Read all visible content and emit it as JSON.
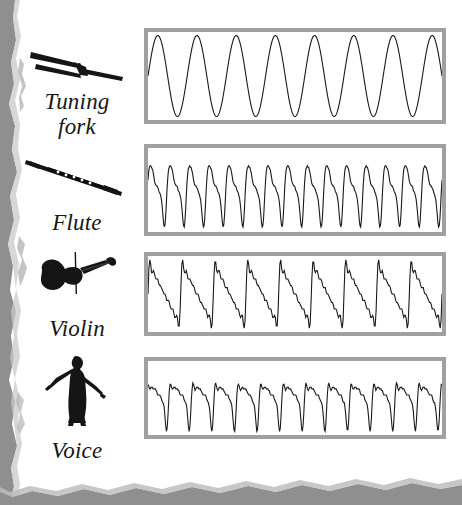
{
  "figure": {
    "background_color": "#ffffff",
    "panel_border_color": "#a0a0a0",
    "wave_color": "#1a1a1a",
    "torn_edge_color": "#8f8f8f"
  },
  "rows": [
    {
      "id": "tuning-fork",
      "label": "Tuning\nfork",
      "label_line1": "Tuning",
      "label_line2": "fork",
      "icon": "tuning-fork-icon"
    },
    {
      "id": "flute",
      "label": "Flute",
      "label_line1": "Flute",
      "label_line2": "",
      "icon": "flute-icon"
    },
    {
      "id": "violin",
      "label": "Violin",
      "label_line1": "Violin",
      "label_line2": "",
      "icon": "violin-icon"
    },
    {
      "id": "voice",
      "label": "Voice",
      "label_line1": "Voice",
      "label_line2": "",
      "icon": "singer-icon"
    }
  ],
  "chart_data": {
    "type": "line",
    "xlabel": "",
    "ylabel": "",
    "grid": false,
    "legend": "none",
    "x": [
      0,
      1
    ],
    "xlim": [
      0,
      1
    ],
    "ylim": [
      -1,
      1
    ],
    "series": [
      {
        "name": "Tuning fork",
        "waveform": "sine",
        "cycles": 7.5,
        "amplitude": 0.92,
        "description": "Pure sinusoid, single frequency, no harmonics",
        "harmonics": [
          {
            "n": 1,
            "amplitude": 1.0,
            "phase": 0.0
          }
        ]
      },
      {
        "name": "Flute",
        "waveform": "complex-periodic",
        "cycles": 15,
        "amplitude": 0.88,
        "description": "Fundamental plus strong second harmonic; rounded double-peak per cycle with deep narrow trough",
        "harmonics": [
          {
            "n": 1,
            "amplitude": 1.0,
            "phase": 0.0
          },
          {
            "n": 2,
            "amplitude": 0.55,
            "phase": 0.35
          },
          {
            "n": 3,
            "amplitude": 0.18,
            "phase": 1.2
          },
          {
            "n": 4,
            "amplitude": 0.1,
            "phase": 2.0
          }
        ]
      },
      {
        "name": "Violin",
        "waveform": "sawtooth",
        "cycles": 9,
        "amplitude": 0.9,
        "description": "Sawtooth-like ramp rising in small steps to a sharp peak, then a steep fall to a narrow trough; rich in all harmonics",
        "harmonics": [
          {
            "n": 1,
            "amplitude": 1.0,
            "phase": 0.0
          },
          {
            "n": 2,
            "amplitude": 0.5,
            "phase": 0.0
          },
          {
            "n": 3,
            "amplitude": 0.33,
            "phase": 0.0
          },
          {
            "n": 4,
            "amplitude": 0.25,
            "phase": 0.0
          },
          {
            "n": 5,
            "amplitude": 0.2,
            "phase": 0.0
          },
          {
            "n": 6,
            "amplitude": 0.167,
            "phase": 0.0
          },
          {
            "n": 7,
            "amplitude": 0.143,
            "phase": 0.0
          },
          {
            "n": 8,
            "amplitude": 0.125,
            "phase": 0.0
          }
        ]
      },
      {
        "name": "Voice",
        "waveform": "complex-periodic",
        "cycles": 13,
        "amplitude": 0.9,
        "description": "Formant-shaped glottal pulse train: one tall spike followed by two smaller ripples per period",
        "harmonics": [
          {
            "n": 1,
            "amplitude": 1.0,
            "phase": 0.0
          },
          {
            "n": 2,
            "amplitude": 0.62,
            "phase": 0.9
          },
          {
            "n": 3,
            "amplitude": 0.45,
            "phase": 1.9
          },
          {
            "n": 4,
            "amplitude": 0.3,
            "phase": 2.6
          },
          {
            "n": 5,
            "amplitude": 0.18,
            "phase": 3.4
          }
        ]
      }
    ]
  }
}
